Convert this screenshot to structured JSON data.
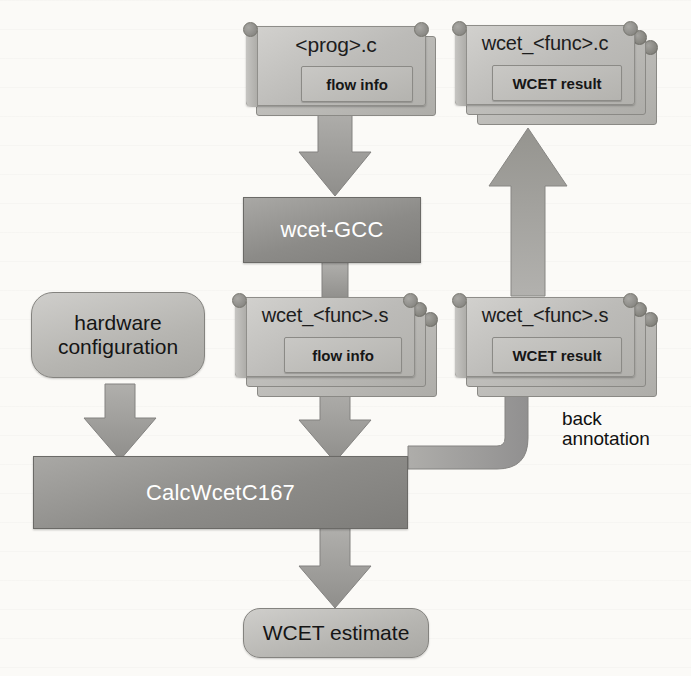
{
  "diagram": {
    "colors": {
      "card_fill": "#c2c1be",
      "process_fill": "#8c8b88",
      "terminator_fill": "#bdbcb8",
      "arrow_fill": "#9a9996",
      "text_dark": "#151515",
      "text_light": "#ffffff"
    },
    "nodes": {
      "prog_c": {
        "title": "<prog>.c",
        "inner": "flow info",
        "stack": 1
      },
      "wcet_func_c": {
        "title": "wcet_<func>.c",
        "inner": "WCET result",
        "stack": 3
      },
      "wcet_gcc": {
        "label": "wcet-GCC"
      },
      "wcet_func_s_left": {
        "title": "wcet_<func>.s",
        "inner": "flow info",
        "stack": 3
      },
      "wcet_func_s_right": {
        "title": "wcet_<func>.s",
        "inner": "WCET result",
        "stack": 3
      },
      "hardware_config": {
        "line1": "hardware",
        "line2": "configuration"
      },
      "calc_wcet": {
        "label": "CalcWcetC167"
      },
      "wcet_estimate": {
        "line1": "WCET estimate",
        "line2": ""
      }
    },
    "edges": [
      {
        "name": "prog-to-gcc",
        "from": "prog_c",
        "to": "wcet_gcc",
        "label": ""
      },
      {
        "name": "gcc-to-asm",
        "from": "wcet_gcc",
        "to": "wcet_func_s_left",
        "label": ""
      },
      {
        "name": "asm-to-calc",
        "from": "wcet_func_s_left",
        "to": "calc_wcet",
        "label": ""
      },
      {
        "name": "hw-to-calc",
        "from": "hardware_config",
        "to": "calc_wcet",
        "label": ""
      },
      {
        "name": "calc-to-estimate",
        "from": "calc_wcet",
        "to": "wcet_estimate",
        "label": ""
      },
      {
        "name": "calc-to-asm-result",
        "from": "calc_wcet",
        "to": "wcet_func_s_right",
        "label": "back annotation"
      },
      {
        "name": "asm-result-to-c-result",
        "from": "wcet_func_s_right",
        "to": "wcet_func_c",
        "label": ""
      }
    ],
    "labels": {
      "back_annotation_line1": "back",
      "back_annotation_line2": "annotation"
    }
  }
}
